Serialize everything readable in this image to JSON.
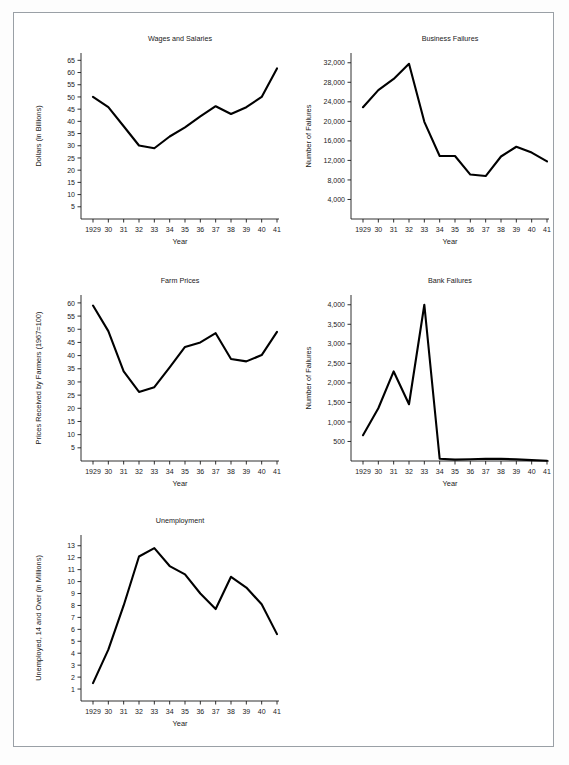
{
  "page": {
    "background": "#ffffff",
    "frame_color": "#9aa0a6",
    "line_color": "#000000"
  },
  "panels": [
    {
      "name": "wages-and-salaries",
      "x": 28,
      "y": 30
    },
    {
      "name": "business-failures",
      "x": 298,
      "y": 30
    },
    {
      "name": "farm-prices",
      "x": 28,
      "y": 272
    },
    {
      "name": "bank-failures",
      "x": 298,
      "y": 272
    },
    {
      "name": "unemployment",
      "x": 28,
      "y": 512
    }
  ],
  "chart_data": [
    {
      "type": "line",
      "title": "Wages and Salaries",
      "xlabel": "Year",
      "ylabel": "Dollars (in Billions)",
      "categories": [
        "1929",
        "30",
        "31",
        "32",
        "33",
        "34",
        "35",
        "36",
        "37",
        "38",
        "39",
        "40",
        "41"
      ],
      "values": [
        50.0,
        45.8,
        38.0,
        30.1,
        29.0,
        33.8,
        37.5,
        42.0,
        46.2,
        43.0,
        45.8,
        50.0,
        61.7
      ],
      "yticks": [
        5,
        10,
        15,
        20,
        25,
        30,
        35,
        40,
        45,
        50,
        55,
        60,
        65
      ],
      "ylim": [
        0,
        68
      ],
      "grid": false,
      "legend": "none"
    },
    {
      "type": "line",
      "title": "Business Failures",
      "xlabel": "Year",
      "ylabel": "Number of Failures",
      "categories": [
        "1929",
        "30",
        "31",
        "32",
        "33",
        "34",
        "35",
        "36",
        "37",
        "38",
        "39",
        "40",
        "41"
      ],
      "values": [
        22900,
        26400,
        28700,
        31800,
        19900,
        12900,
        12900,
        9100,
        8800,
        12800,
        14800,
        13600,
        11800
      ],
      "yticks": [
        4000,
        8000,
        12000,
        16000,
        20000,
        24000,
        28000,
        32000
      ],
      "ytick_labels": [
        "4,000",
        "8,000",
        "12,000",
        "16,000",
        "20,000",
        "24,000",
        "28,000",
        "32,000"
      ],
      "ylim": [
        0,
        34000
      ],
      "grid": false,
      "legend": "none"
    },
    {
      "type": "line",
      "title": "Farm Prices",
      "xlabel": "Year",
      "ylabel": "Prices Received by Farmers (1967=100)",
      "categories": [
        "1929",
        "30",
        "31",
        "32",
        "33",
        "34",
        "35",
        "36",
        "37",
        "38",
        "39",
        "40",
        "41"
      ],
      "values": [
        59.0,
        49.3,
        34.0,
        26.2,
        28.0,
        35.5,
        43.3,
        45.0,
        48.5,
        38.7,
        37.8,
        40.2,
        49.0
      ],
      "yticks": [
        5,
        10,
        15,
        20,
        25,
        30,
        35,
        40,
        45,
        50,
        55,
        60
      ],
      "ylim": [
        0,
        63
      ],
      "grid": false,
      "legend": "none"
    },
    {
      "type": "line",
      "title": "Bank Failures",
      "xlabel": "Year",
      "ylabel": "Number of Failures",
      "categories": [
        "1929",
        "30",
        "31",
        "32",
        "33",
        "34",
        "35",
        "36",
        "37",
        "38",
        "39",
        "40",
        "41"
      ],
      "values": [
        659,
        1350,
        2293,
        1453,
        4000,
        57,
        34,
        44,
        59,
        54,
        42,
        22,
        8
      ],
      "yticks": [
        500,
        1000,
        1500,
        2000,
        2500,
        3000,
        3500,
        4000
      ],
      "ytick_labels": [
        "500",
        "1,000",
        "1,500",
        "2,000",
        "2,500",
        "3,000",
        "3,500",
        "4,000"
      ],
      "ylim": [
        0,
        4250
      ],
      "grid": false,
      "legend": "none"
    },
    {
      "type": "line",
      "title": "Unemployment",
      "xlabel": "Year",
      "ylabel": "Unemployed, 14 and Over (in Millions)",
      "categories": [
        "1929",
        "30",
        "31",
        "32",
        "33",
        "34",
        "35",
        "36",
        "37",
        "38",
        "39",
        "40",
        "41"
      ],
      "values": [
        1.5,
        4.3,
        8.0,
        12.1,
        12.8,
        11.3,
        10.6,
        9.0,
        7.7,
        10.4,
        9.5,
        8.1,
        5.6
      ],
      "yticks": [
        1,
        2,
        3,
        4,
        5,
        6,
        7,
        8,
        9,
        10,
        11,
        12,
        13
      ],
      "ylim": [
        0,
        13.9
      ],
      "grid": false,
      "legend": "none"
    }
  ]
}
